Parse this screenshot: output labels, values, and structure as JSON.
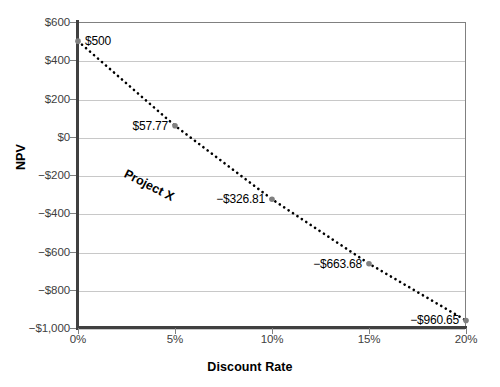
{
  "chart_data": {
    "type": "line",
    "title": "",
    "xlabel": "Discount Rate",
    "ylabel": "NPV",
    "xlim": [
      0,
      20
    ],
    "ylim": [
      -1000,
      600
    ],
    "grid": "horizontal",
    "legend": "none",
    "series_name": "Project X",
    "x": [
      0,
      5,
      10,
      15,
      20
    ],
    "values": [
      500,
      57.77,
      -326.81,
      -663.68,
      -960.65
    ],
    "xtick_labels": [
      "0%",
      "5%",
      "10%",
      "15%",
      "20%"
    ],
    "xtick_values": [
      0,
      5,
      10,
      15,
      20
    ],
    "ytick_labels": [
      "$600",
      "$400",
      "$200",
      "$0",
      "−$200",
      "−$400",
      "−$600",
      "−$800",
      "−$1,000"
    ],
    "ytick_values": [
      600,
      400,
      200,
      0,
      -200,
      -400,
      -600,
      -800,
      -1000
    ],
    "point_labels": [
      {
        "text": "$500",
        "value": 500,
        "x": 0,
        "align": "left"
      },
      {
        "text": "$57.77",
        "value": 57.77,
        "x": 5,
        "align": "right"
      },
      {
        "text": "−$326.81",
        "value": -326.81,
        "x": 10,
        "align": "right"
      },
      {
        "text": "−$663.68",
        "value": -663.68,
        "x": 15,
        "align": "right"
      },
      {
        "text": "−$960.65",
        "value": -960.65,
        "x": 20,
        "align": "right"
      }
    ],
    "colors": {
      "line": "#000000",
      "marker": "#808080",
      "grid": "#c8c8c8",
      "axis": "#404040",
      "tick_text": "#404040",
      "title_text": "#000000",
      "background": "#ffffff"
    },
    "annotations": [
      {
        "text": "Project X",
        "rotation_deg": 27,
        "x_pct": 12,
        "y_pct": 47
      }
    ]
  }
}
